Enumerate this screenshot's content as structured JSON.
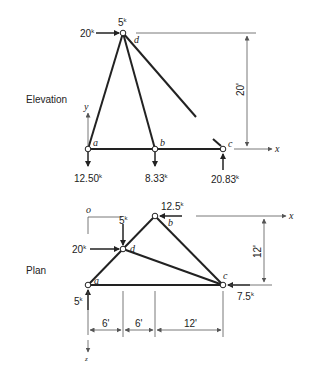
{
  "views": {
    "elevation": {
      "title": "Elevation",
      "nodes": {
        "a": "a",
        "b": "b",
        "c": "c",
        "d": "d"
      },
      "loads": {
        "top_vertical": "5",
        "top_horizontal": "20",
        "reaction_a": "12.50",
        "reaction_b": "8.33",
        "reaction_c": "20.83"
      },
      "unit": "k",
      "dimension_height": "20'",
      "axes": {
        "x": "x",
        "y": "y"
      }
    },
    "plan": {
      "title": "Plan",
      "nodes": {
        "a": "a",
        "b": "b",
        "c": "c",
        "d": "d",
        "o": "o"
      },
      "loads": {
        "at_b": "12.5",
        "at_d_vertical": "5",
        "at_d_horizontal": "20",
        "at_a": "5",
        "at_c": "7.5"
      },
      "unit": "k",
      "dimensions": {
        "seg1": "6'",
        "seg2": "6'",
        "seg3": "12'",
        "height": "12'"
      },
      "axes": {
        "x": "x",
        "z": "z"
      }
    }
  },
  "colors": {
    "line": "#222222",
    "dim": "#555555",
    "background": "#ffffff"
  }
}
